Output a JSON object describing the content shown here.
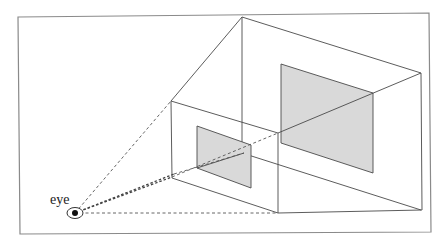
{
  "diagram": {
    "type": "perspective-projection",
    "labels": {
      "eye": "eye"
    },
    "colors": {
      "background": "#ffffff",
      "frame": "#8a8a8a",
      "edges": "#4a4a4a",
      "panel_fill": "#d9d9d9",
      "pupil": "#111111"
    },
    "elements": {
      "eye_point": [
        75,
        213
      ],
      "near_plane_panel": [
        [
          197,
          126
        ],
        [
          251,
          145
        ],
        [
          251,
          188
        ],
        [
          197,
          168
        ]
      ],
      "far_plane_panel": [
        [
          281,
          64
        ],
        [
          373,
          93
        ],
        [
          373,
          173
        ],
        [
          281,
          143
        ]
      ]
    }
  }
}
